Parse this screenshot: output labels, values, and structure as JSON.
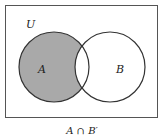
{
  "diagram": {
    "type": "venn",
    "universe_label": "U",
    "sets": [
      {
        "label": "A",
        "shaded": "A minus B"
      },
      {
        "label": "B",
        "shaded": "none"
      }
    ],
    "caption": "A ∩ B′",
    "colors": {
      "shade": "#a9a9a9",
      "stroke": "#333333",
      "frame": "#555555",
      "background": "#ffffff"
    }
  }
}
